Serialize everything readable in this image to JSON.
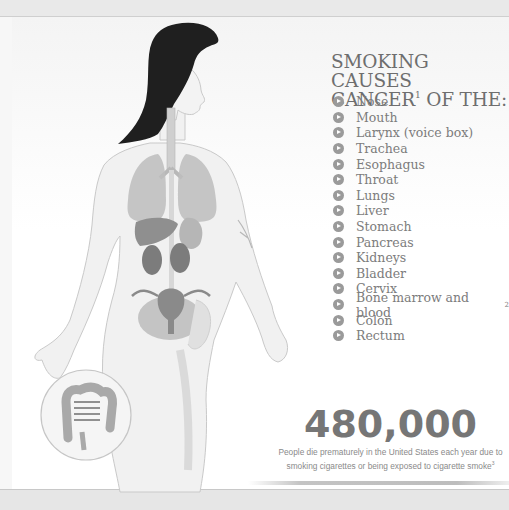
{
  "heading": {
    "line1": "SMOKING CAUSES",
    "line2_prefix": "CANCER",
    "line2_sup": "1",
    "line2_suffix": " OF THE:"
  },
  "cancer_sites": [
    {
      "label": "Nose",
      "sup": ""
    },
    {
      "label": "Mouth",
      "sup": ""
    },
    {
      "label": "Larynx (voice box)",
      "sup": ""
    },
    {
      "label": "Trachea",
      "sup": ""
    },
    {
      "label": "Esophagus",
      "sup": ""
    },
    {
      "label": "Throat",
      "sup": ""
    },
    {
      "label": "Lungs",
      "sup": ""
    },
    {
      "label": "Liver",
      "sup": ""
    },
    {
      "label": "Stomach",
      "sup": ""
    },
    {
      "label": "Pancreas",
      "sup": ""
    },
    {
      "label": "Kidneys",
      "sup": ""
    },
    {
      "label": "Bladder",
      "sup": ""
    },
    {
      "label": "Cervix",
      "sup": ""
    },
    {
      "label": "Bone marrow and blood",
      "sup": "2"
    },
    {
      "label": "Colon",
      "sup": ""
    },
    {
      "label": "Rectum",
      "sup": ""
    }
  ],
  "stat": {
    "number": "480,000",
    "caption_line1": "People die prematurely in the United States each year due to",
    "caption_line2": "smoking cigarettes or being exposed to cigarette smoke",
    "caption_sup": "3"
  },
  "illustration": {
    "subject": "female anatomy figure with highlighted organs",
    "inset": "colon and rectum close-up circle"
  },
  "colors": {
    "heading": "#6e6e6e",
    "list_text": "#7c7c7c",
    "bullet": "#9a9a9a",
    "stat_number": "#767676",
    "hair": "#1f1f1f",
    "organ": "#9e9e9e"
  }
}
